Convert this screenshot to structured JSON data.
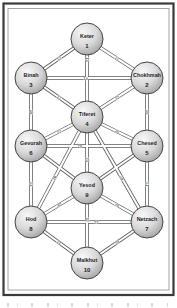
{
  "diagram": {
    "nodes": [
      {
        "id": "keter",
        "name": "Keter",
        "number": "1",
        "x": 87,
        "y": 39
      },
      {
        "id": "chokhmah",
        "name": "Chokhmah",
        "number": "2",
        "x": 147,
        "y": 78
      },
      {
        "id": "binah",
        "name": "Binah",
        "number": "3",
        "x": 31,
        "y": 78
      },
      {
        "id": "tiferet",
        "name": "Tiferet",
        "number": "4",
        "x": 87,
        "y": 117
      },
      {
        "id": "chesed",
        "name": "Chesed",
        "number": "5",
        "x": 147,
        "y": 146
      },
      {
        "id": "gevurah",
        "name": "Gevurah",
        "number": "6",
        "x": 31,
        "y": 146
      },
      {
        "id": "netzach",
        "name": "Netzach",
        "number": "7",
        "x": 147,
        "y": 222
      },
      {
        "id": "hod",
        "name": "Hod",
        "number": "8",
        "x": 31,
        "y": 222
      },
      {
        "id": "yesod",
        "name": "Yesod",
        "number": "9",
        "x": 87,
        "y": 188
      },
      {
        "id": "malkhut",
        "name": "Malkhut",
        "number": "10",
        "x": 87,
        "y": 263
      }
    ],
    "edges": [
      {
        "from": "keter",
        "to": "chokhmah",
        "label": "11"
      },
      {
        "from": "keter",
        "to": "binah",
        "label": "12"
      },
      {
        "from": "keter",
        "to": "tiferet",
        "label": "13",
        "f": 0.26
      },
      {
        "from": "binah",
        "to": "chokhmah",
        "label": "14",
        "f": 0.47
      },
      {
        "from": "chokhmah",
        "to": "tiferet",
        "label": "15"
      },
      {
        "from": "chokhmah",
        "to": "chesed",
        "label": "16"
      },
      {
        "from": "binah",
        "to": "tiferet",
        "label": "17"
      },
      {
        "from": "binah",
        "to": "gevurah",
        "label": "18"
      },
      {
        "from": "gevurah",
        "to": "chesed",
        "label": "19",
        "f": 0.42
      },
      {
        "from": "chesed",
        "to": "tiferet",
        "label": "20"
      },
      {
        "from": "chesed",
        "to": "netzach",
        "label": "21"
      },
      {
        "from": "gevurah",
        "to": "tiferet",
        "label": "22"
      },
      {
        "from": "gevurah",
        "to": "hod",
        "label": "23"
      },
      {
        "from": "tiferet",
        "to": "netzach",
        "label": "24",
        "f": 0.58
      },
      {
        "from": "tiferet",
        "to": "yesod",
        "label": "25",
        "f": 0.6
      },
      {
        "from": "tiferet",
        "to": "hod",
        "label": "26",
        "f": 0.58
      },
      {
        "from": "hod",
        "to": "netzach",
        "label": "27",
        "f": 0.56
      },
      {
        "from": "netzach",
        "to": "yesod",
        "label": "28"
      },
      {
        "from": "netzach",
        "to": "malkhut",
        "label": "29"
      },
      {
        "from": "hod",
        "to": "yesod",
        "label": "30"
      },
      {
        "from": "hod",
        "to": "malkhut",
        "label": "31"
      },
      {
        "from": "yesod",
        "to": "malkhut",
        "label": "32",
        "f": 0.42
      },
      {
        "from": "gevurah",
        "to": "yesod",
        "label": ""
      },
      {
        "from": "chesed",
        "to": "yesod",
        "label": ""
      }
    ],
    "colors": {
      "background": "#ffffff",
      "frame_outer": "#3a3a3a",
      "frame_inner": "#9a9a9a",
      "edge_outline": "#5a5a5a",
      "edge_fill": "#ffffff",
      "edge_label": "#2a2a2a",
      "node_fill_light": "#f8f8f8",
      "node_fill_mid": "#d9d9d9",
      "node_fill_dark": "#a3a3a3",
      "node_border": "#454545",
      "node_text": "#1d1d28"
    }
  }
}
